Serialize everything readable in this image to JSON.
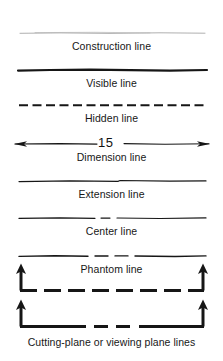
{
  "page": {
    "background": "#ffffff",
    "ink": "#171717"
  },
  "rows": [
    {
      "id": "construction-line",
      "label": "Construction line",
      "line_style": "thin-continuous-light",
      "stroke": "#9a9a9a",
      "stroke_width": 0.7,
      "dash": "none",
      "line_y": 33,
      "label_y": 41,
      "x_start": 20,
      "x_end": 205
    },
    {
      "id": "visible-line",
      "label": "Visible line",
      "line_style": "thick-continuous",
      "stroke": "#161616",
      "stroke_width": 2.1,
      "dash": "none",
      "line_y": 70,
      "label_y": 78,
      "x_start": 18,
      "x_end": 207
    },
    {
      "id": "hidden-line",
      "label": "Hidden line",
      "line_style": "medium-dashed",
      "stroke": "#161616",
      "stroke_width": 2.0,
      "dash": "9 4",
      "line_y": 105,
      "label_y": 113,
      "x_start": 19,
      "x_end": 206
    },
    {
      "id": "dimension-line",
      "label": "Dimension line",
      "line_style": "thin-continuous-with-arrowheads",
      "stroke": "#161616",
      "stroke_width": 1.0,
      "dash": "none",
      "line_y": 143,
      "label_y": 152,
      "x_start": 14,
      "x_end": 210,
      "dimension_value": "15"
    },
    {
      "id": "extension-line",
      "label": "Extension line",
      "line_style": "thin-continuous",
      "stroke": "#161616",
      "stroke_width": 1.1,
      "dash": "none",
      "line_y": 181,
      "label_y": 189,
      "x_start": 19,
      "x_end": 206
    },
    {
      "id": "center-line",
      "label": "Center line",
      "line_style": "long-short-long-dashed",
      "stroke": "#161616",
      "stroke_width": 1.1,
      "dash": "50 5 9 5",
      "line_y": 218,
      "label_y": 226,
      "x_start": 19,
      "x_end": 206
    },
    {
      "id": "phantom-line",
      "label": "Phantom line",
      "line_style": "long-short-short-long-dashed",
      "stroke": "#161616",
      "stroke_width": 1.3,
      "dash": "48 5 9 5 9 5",
      "line_y": 256,
      "label_y": 264,
      "x_start": 19,
      "x_end": 206
    }
  ],
  "cutting_planes": {
    "label": "Cutting-plane or viewing plane lines",
    "label_y": 337,
    "stroke": "#161616",
    "stroke_width": 3.0,
    "arrow_stroke_width": 3.0,
    "variants": [
      {
        "id": "cutting-plane-dashed",
        "dash": "16 7",
        "line_y": 291,
        "arrow_top_y": 265,
        "x_start": 19,
        "x_end": 205
      },
      {
        "id": "cutting-plane-long-short",
        "dash": "38 6 9 6 9 6",
        "line_y": 327,
        "arrow_top_y": 301,
        "x_start": 19,
        "x_end": 205
      }
    ]
  }
}
